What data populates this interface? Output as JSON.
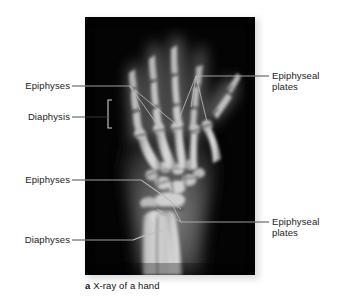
{
  "figure": {
    "caption_marker": "a",
    "caption_text": " X-ray of a hand",
    "plate_bg": "#050505",
    "label_color": "#1c1c1c",
    "leader_color_dark": "#3a3a3a",
    "leader_color_light": "#b9b9b9"
  },
  "labels": {
    "left": [
      {
        "id": "epiphyses-upper",
        "text": "Epiphyses"
      },
      {
        "id": "diaphysis-upper",
        "text": "Diaphysis"
      },
      {
        "id": "epiphyses-lower",
        "text": "Epiphyses"
      },
      {
        "id": "diaphyses-lower",
        "text": "Diaphyses"
      }
    ],
    "right": [
      {
        "id": "epiphyseal-plates-upper",
        "line1": "Epiphyseal",
        "line2": "plates"
      },
      {
        "id": "epiphyseal-plates-lower",
        "line1": "Epiphyseal",
        "line2": "plates"
      }
    ]
  }
}
